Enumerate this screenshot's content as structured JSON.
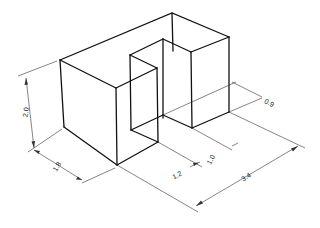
{
  "figure": {
    "type": "isometric technical drawing",
    "line_color": "#111111",
    "background": "#ffffff"
  },
  "dimensions": {
    "height": "2.0",
    "depth": "1.8",
    "notch_depth": "0.9",
    "notch_width": "1.0",
    "front_width": "1.2",
    "overall_width": "3.4"
  }
}
